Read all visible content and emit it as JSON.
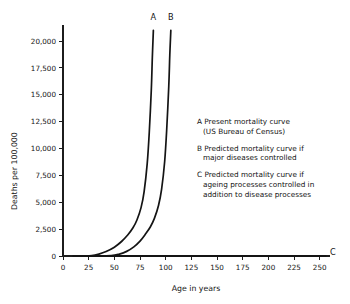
{
  "chart_data": {
    "type": "line",
    "title": "",
    "xlabel": "Age in years",
    "ylabel": "Deaths per 100,000",
    "xlim": [
      0,
      260
    ],
    "ylim": [
      0,
      21500
    ],
    "grid": false,
    "legend_position": "inside-right",
    "xticks": [
      "0",
      "25",
      "50",
      "75",
      "100",
      "125",
      "150",
      "175",
      "200",
      "225",
      "250"
    ],
    "xtick_values": [
      0,
      25,
      50,
      75,
      100,
      125,
      150,
      175,
      200,
      225,
      250
    ],
    "yticks": [
      "0",
      "2,500",
      "5,000",
      "7,500",
      "10,000",
      "12,500",
      "15,000",
      "17,500",
      "20,000"
    ],
    "ytick_values": [
      0,
      2500,
      5000,
      7500,
      10000,
      12500,
      15000,
      17500,
      20000
    ],
    "series": [
      {
        "name": "A",
        "label": "A",
        "description": "Present mortality curve (US Bureau of Census)",
        "x": [
          10,
          20,
          28,
          35,
          42,
          50,
          57,
          63,
          68,
          72,
          76,
          79,
          82,
          84,
          86,
          87,
          88
        ],
        "y": [
          0,
          0,
          30,
          180,
          420,
          820,
          1350,
          1950,
          2600,
          3350,
          4500,
          6000,
          8600,
          11500,
          15500,
          18500,
          21000
        ]
      },
      {
        "name": "B",
        "label": "B",
        "description": "Predicted mortality curve if major diseases controlled",
        "x": [
          10,
          30,
          47,
          55,
          62,
          69,
          75,
          80,
          85,
          89,
          93,
          96,
          99,
          101,
          103,
          104,
          105
        ],
        "y": [
          0,
          0,
          30,
          180,
          430,
          850,
          1380,
          2000,
          2700,
          3500,
          4700,
          6200,
          8800,
          11800,
          15800,
          18700,
          21000
        ]
      },
      {
        "name": "C",
        "label": "C",
        "description": "Predicted mortality curve if ageing processes controlled in addition to disease processes",
        "x": [
          10,
          50,
          100,
          150,
          200,
          250,
          255
        ],
        "y": [
          0,
          0,
          0,
          0,
          0,
          0,
          0
        ]
      }
    ],
    "curve_labels": [
      {
        "label": "A",
        "at_x": 88,
        "position": "top"
      },
      {
        "label": "B",
        "at_x": 105,
        "position": "top"
      },
      {
        "label": "C",
        "at_x": 256,
        "position": "right"
      }
    ],
    "legend": [
      {
        "key": "A",
        "lines": [
          "A Present mortality curve",
          "(US Bureau of Census)"
        ]
      },
      {
        "key": "B",
        "lines": [
          "B Predicted mortality curve if",
          "major diseases controlled"
        ]
      },
      {
        "key": "C",
        "lines": [
          "C Predicted mortality curve if",
          "ageing processes controlled in",
          "addition to disease processes"
        ]
      }
    ],
    "colors": {
      "background": "#ffffff",
      "axis": "#1c1c1c",
      "curve": "#141414",
      "text": "#141414"
    }
  }
}
